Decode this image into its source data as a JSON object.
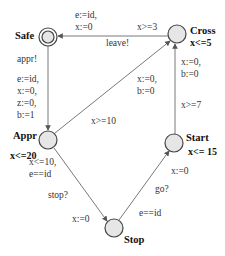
{
  "locations": {
    "safe": {
      "name": "Safe",
      "invariant": "",
      "initial": true
    },
    "cross": {
      "name": "Cross",
      "invariant": "x<=5"
    },
    "appr": {
      "name": "Appr",
      "invariant": "x<=20"
    },
    "start": {
      "name": "Start",
      "invariant": "x<= 15"
    },
    "stop": {
      "name": "Stop",
      "invariant": ""
    }
  },
  "edges": {
    "cross_to_safe": {
      "guard": "x>=3",
      "sync": "leave!",
      "update_1": "e:=id,",
      "update_2": "x:=0"
    },
    "safe_to_appr": {
      "sync": "appr!",
      "update_1": "e:=id,",
      "update_2": "x:=0,",
      "update_3": "z:=0,",
      "update_4": "b:=1"
    },
    "appr_to_cross": {
      "guard": "x>=10",
      "update_1": "x:=0,",
      "update_2": "b:=0"
    },
    "appr_to_stop": {
      "guard_1": "x<=10,",
      "guard_2": "e==id",
      "sync": "stop?",
      "update": "x:=0"
    },
    "stop_to_start": {
      "guard": "e==id",
      "sync": "go?",
      "update": "x:=0"
    },
    "start_to_cross": {
      "guard": "x>=7",
      "update_1": "x:=0,",
      "update_2": "b:=0"
    }
  },
  "colors": {
    "node_fill": "#e6e6e6",
    "stroke": "#555555"
  }
}
